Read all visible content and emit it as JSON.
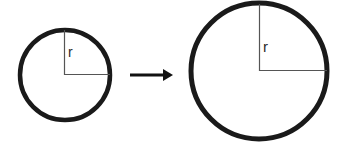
{
  "figure": {
    "name": "circle-radius-growth-diagram",
    "background_color": "#ffffff",
    "width": 345,
    "height": 145
  },
  "colors": {
    "circle_stroke": "#1a1a1a",
    "radius_line": "#555555",
    "arrow": "#111111",
    "label_text": "#2b2b2b"
  },
  "shapes": {
    "small_circle": {
      "name": "small circle",
      "cx": 65,
      "cy": 75,
      "r": 45,
      "stroke_width": 4.5,
      "radius_label": "r",
      "label_x": 68,
      "label_y": 57,
      "label_font_size": 14
    },
    "large_circle": {
      "name": "large circle",
      "cx": 259,
      "cy": 71,
      "r": 68,
      "stroke_width": 5,
      "radius_label": "r",
      "label_x": 263,
      "label_y": 52,
      "label_font_size": 15
    },
    "arrow": {
      "name": "transformation arrow",
      "x_start": 130,
      "x_end": 173,
      "y": 75,
      "shaft_thickness": 3,
      "head_length": 10,
      "head_half_height": 6,
      "direction": "right"
    }
  },
  "labels": {
    "small_radius": "r",
    "large_radius": "r"
  }
}
